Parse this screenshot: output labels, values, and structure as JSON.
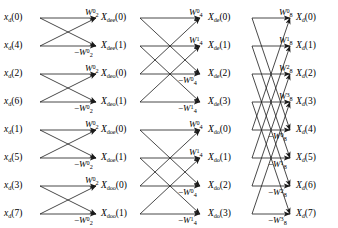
{
  "figure": {
    "type": "radix-2 decimation-in-time FFT signal flow graph",
    "size": 8,
    "stages": 3
  },
  "stage1": {
    "name": "stage-1-two-point-dfts",
    "inputs": [
      {
        "base": "x",
        "sub": "d",
        "index": "(0)"
      },
      {
        "base": "x",
        "sub": "d",
        "index": "(4)"
      },
      {
        "base": "x",
        "sub": "d",
        "index": "(2)"
      },
      {
        "base": "x",
        "sub": "d",
        "index": "(6)"
      },
      {
        "base": "x",
        "sub": "d",
        "index": "(1)"
      },
      {
        "base": "x",
        "sub": "d",
        "index": "(5)"
      },
      {
        "base": "x",
        "sub": "d",
        "index": "(3)"
      },
      {
        "base": "x",
        "sub": "d",
        "index": "(7)"
      }
    ],
    "twiddles": [
      {
        "sign": "",
        "base": "W",
        "sub": "2",
        "sup": "0"
      },
      {
        "sign": "−",
        "base": "W",
        "sub": "2",
        "sup": "0"
      },
      {
        "sign": "",
        "base": "W",
        "sub": "2",
        "sup": "0"
      },
      {
        "sign": "−",
        "base": "W",
        "sub": "2",
        "sup": "0"
      },
      {
        "sign": "",
        "base": "W",
        "sub": "2",
        "sup": "0"
      },
      {
        "sign": "−",
        "base": "W",
        "sub": "2",
        "sup": "0"
      },
      {
        "sign": "",
        "base": "W",
        "sub": "2",
        "sup": "0"
      },
      {
        "sign": "−",
        "base": "W",
        "sub": "2",
        "sup": "0"
      }
    ]
  },
  "stage2": {
    "name": "stage-2-four-point-dfts",
    "inputs": [
      {
        "base": "X",
        "sub": "dee",
        "index": "(0)"
      },
      {
        "base": "X",
        "sub": "dee",
        "index": "(1)"
      },
      {
        "base": "X",
        "sub": "deo",
        "index": "(0)"
      },
      {
        "base": "X",
        "sub": "deo",
        "index": "(1)"
      },
      {
        "base": "X",
        "sub": "doe",
        "index": "(0)"
      },
      {
        "base": "X",
        "sub": "doe",
        "index": "(1)"
      },
      {
        "base": "X",
        "sub": "doo",
        "index": "(0)"
      },
      {
        "base": "X",
        "sub": "doo",
        "index": "(1)"
      }
    ],
    "twiddles": [
      {
        "sign": "",
        "base": "W",
        "sub": "4",
        "sup": "0"
      },
      {
        "sign": "",
        "base": "W",
        "sub": "4",
        "sup": "1"
      },
      {
        "sign": "−",
        "base": "W",
        "sub": "4",
        "sup": "0"
      },
      {
        "sign": "−",
        "base": "W",
        "sub": "4",
        "sup": "1"
      },
      {
        "sign": "",
        "base": "W",
        "sub": "4",
        "sup": "0"
      },
      {
        "sign": "",
        "base": "W",
        "sub": "4",
        "sup": "1"
      },
      {
        "sign": "−",
        "base": "W",
        "sub": "4",
        "sup": "0"
      },
      {
        "sign": "−",
        "base": "W",
        "sub": "4",
        "sup": "1"
      }
    ]
  },
  "stage3": {
    "name": "stage-3-eight-point-dft",
    "inputs": [
      {
        "base": "X",
        "sub": "de",
        "index": "(0)"
      },
      {
        "base": "X",
        "sub": "de",
        "index": "(1)"
      },
      {
        "base": "X",
        "sub": "de",
        "index": "(2)"
      },
      {
        "base": "X",
        "sub": "de",
        "index": "(3)"
      },
      {
        "base": "X",
        "sub": "do",
        "index": "(0)"
      },
      {
        "base": "X",
        "sub": "do",
        "index": "(1)"
      },
      {
        "base": "X",
        "sub": "do",
        "index": "(2)"
      },
      {
        "base": "X",
        "sub": "do",
        "index": "(3)"
      }
    ],
    "twiddles": [
      {
        "sign": "",
        "base": "W",
        "sub": "8",
        "sup": "0"
      },
      {
        "sign": "",
        "base": "W",
        "sub": "8",
        "sup": "1"
      },
      {
        "sign": "",
        "base": "W",
        "sub": "8",
        "sup": "2"
      },
      {
        "sign": "",
        "base": "W",
        "sub": "8",
        "sup": "3"
      },
      {
        "sign": "−",
        "base": "W",
        "sub": "8",
        "sup": "0"
      },
      {
        "sign": "−",
        "base": "W",
        "sub": "8",
        "sup": "1"
      },
      {
        "sign": "−",
        "base": "W",
        "sub": "8",
        "sup": "2"
      },
      {
        "sign": "−",
        "base": "W",
        "sub": "8",
        "sup": "3"
      }
    ],
    "outputs": [
      {
        "base": "X",
        "sub": "d",
        "index": "(0)"
      },
      {
        "base": "X",
        "sub": "d",
        "index": "(1)"
      },
      {
        "base": "X",
        "sub": "d",
        "index": "(2)"
      },
      {
        "base": "X",
        "sub": "d",
        "index": "(3)"
      },
      {
        "base": "X",
        "sub": "d",
        "index": "(4)"
      },
      {
        "base": "X",
        "sub": "d",
        "index": "(5)"
      },
      {
        "base": "X",
        "sub": "d",
        "index": "(6)"
      },
      {
        "base": "X",
        "sub": "d",
        "index": "(7)"
      }
    ]
  },
  "style": {
    "line_color": "#1a1a1a",
    "background": "#ffffff"
  }
}
